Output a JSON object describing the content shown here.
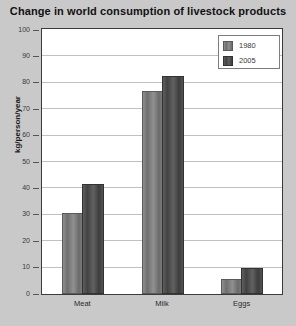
{
  "chart_data": {
    "type": "bar",
    "title": "Change in world consumption of livestock products",
    "xlabel": "",
    "ylabel": "kg/person/year",
    "categories": [
      "Meat",
      "Milk",
      "Eggs"
    ],
    "series": [
      {
        "name": "1980",
        "values": [
          30,
          76,
          5
        ],
        "color": "#7d7d7d"
      },
      {
        "name": "2005",
        "values": [
          41,
          82,
          9
        ],
        "color": "#4a4a4a"
      }
    ],
    "ylim": [
      0,
      100
    ],
    "yticks": [
      0,
      10,
      20,
      30,
      40,
      50,
      60,
      70,
      80,
      90,
      100
    ],
    "ytick_labels": [
      "0",
      "10",
      "20",
      "30",
      "40",
      "50",
      "60",
      "70",
      "80",
      "90",
      "100"
    ],
    "grid": true,
    "legend_position": "top-right",
    "plot_background": "#ffffff",
    "figure_background": "#c9c9c9"
  }
}
